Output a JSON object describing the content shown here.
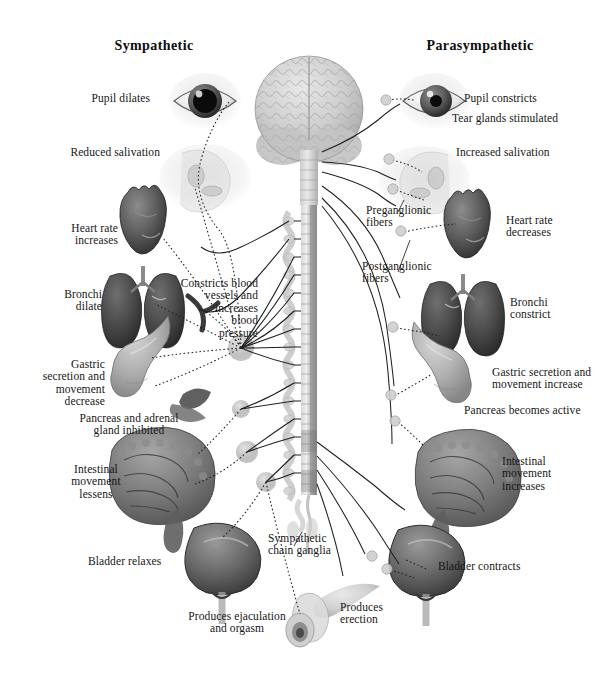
{
  "figure": {
    "kind": "anatomical-diagram",
    "background_color": "#ffffff",
    "ink_color": "#161616"
  },
  "titles": {
    "left": "Sympathetic",
    "right": "Parasympathetic"
  },
  "sympathetic_labels": [
    {
      "id": "pupil-dilates",
      "text": "Pupil dilates"
    },
    {
      "id": "reduced-salivation",
      "text": "Reduced salivation"
    },
    {
      "id": "heart-rate-increases",
      "text": "Heart rate\nincreases"
    },
    {
      "id": "bronchi-dilate",
      "text": "Bronchi\ndilate"
    },
    {
      "id": "gastric-decrease",
      "text": "Gastric\nsecretion and\nmovement\ndecrease"
    },
    {
      "id": "pancreas-inhibited",
      "text": "Pancreas and adrenal\ngland inhibited"
    },
    {
      "id": "intestinal-lessens",
      "text": "Intestinal\nmovement\nlessens"
    },
    {
      "id": "bladder-relaxes",
      "text": "Bladder relaxes"
    },
    {
      "id": "ejaculation",
      "text": "Produces ejaculation\nand orgasm"
    }
  ],
  "parasympathetic_labels": [
    {
      "id": "pupil-constricts",
      "text": "Pupil constricts"
    },
    {
      "id": "tear-glands",
      "text": "Tear glands stimulated"
    },
    {
      "id": "increased-salivation",
      "text": "Increased salivation"
    },
    {
      "id": "heart-rate-decreases",
      "text": "Heart rate\ndecreases"
    },
    {
      "id": "bronchi-constrict",
      "text": "Bronchi\nconstrict"
    },
    {
      "id": "gastric-increase",
      "text": "Gastric secretion and\nmovement increase"
    },
    {
      "id": "pancreas-active",
      "text": "Pancreas becomes active"
    },
    {
      "id": "intestinal-increases",
      "text": "Intestinal\nmovement\nincreases"
    },
    {
      "id": "bladder-contracts",
      "text": "Bladder contracts"
    },
    {
      "id": "erection",
      "text": "Produces\nerection"
    }
  ],
  "center_labels": [
    {
      "id": "constricts-blood-vessels",
      "text": "Constricts blood\nvessels and\nincreases\nblood\npressure"
    },
    {
      "id": "sympathetic-chain-ganglia",
      "text": "Sympathetic\nchain ganglia"
    }
  ],
  "fiber_legend": [
    {
      "id": "preganglionic-fibers",
      "text": "Preganglionic\nfibers",
      "line_style": "solid"
    },
    {
      "id": "postganglionic-fibers",
      "text": "Postganglionic\nfibers",
      "line_style": "dotted"
    }
  ],
  "organs_left": [
    "eye-dilated",
    "head-salivary",
    "heart",
    "lungs",
    "blood-vessel",
    "stomach",
    "pancreas-adrenal",
    "intestines",
    "bladder",
    "genitals"
  ],
  "organs_right": [
    "eye-constricted",
    "head-salivary",
    "heart",
    "lungs",
    "stomach",
    "intestines",
    "bladder"
  ],
  "central_structures": [
    "brain",
    "brainstem",
    "spinal-cord",
    "sympathetic-chain"
  ]
}
